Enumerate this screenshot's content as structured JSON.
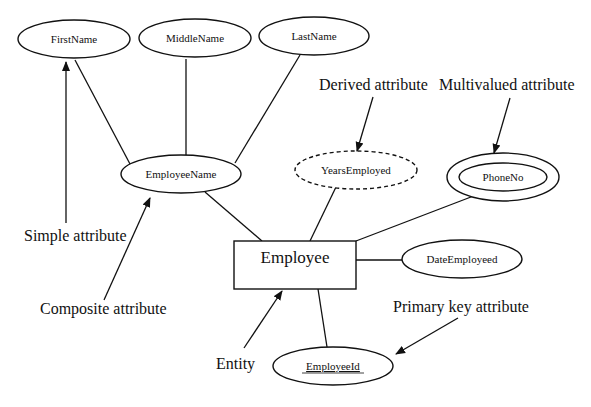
{
  "diagram": {
    "type": "ER diagram",
    "entity": {
      "label": "Employee"
    },
    "attributes": {
      "first_name": "FirstName",
      "middle_name": "MiddleName",
      "last_name": "LastName",
      "employee_name": "EmployeeName",
      "years_employed": "YearsEmployed",
      "phone_no": "PhoneNo",
      "date_employed": "DateEmployeed",
      "employee_id": "EmployeeId"
    },
    "annotations": {
      "simple": "Simple attribute",
      "composite": "Composite attribute",
      "derived": "Derived attribute",
      "multivalued": "Multivalued attribute",
      "primary_key": "Primary key attribute",
      "entity": "Entity"
    },
    "colors": {
      "stroke": "#111111",
      "background": "#ffffff"
    }
  }
}
